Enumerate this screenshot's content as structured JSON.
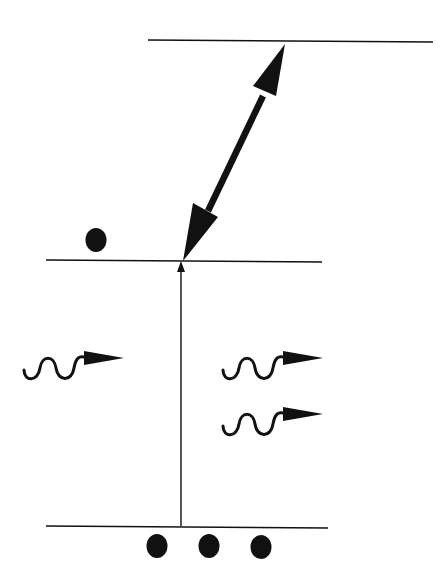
{
  "diagram": {
    "type": "energy-level-diagram",
    "colors": {
      "stroke": "#111111",
      "background": "#ffffff"
    },
    "levels": [
      {
        "id": "upper",
        "x1": 148,
        "x2": 433,
        "y": 41
      },
      {
        "id": "middle",
        "x1": 46,
        "x2": 322,
        "y": 261
      },
      {
        "id": "ground",
        "x1": 46,
        "x2": 328,
        "y": 527
      }
    ],
    "transitions": [
      {
        "id": "pump",
        "style": "thin-single-arrow",
        "from": "ground",
        "to": "middle"
      },
      {
        "id": "coupling",
        "style": "thick-double-arrow",
        "between": [
          "middle",
          "upper"
        ]
      }
    ],
    "photons": [
      {
        "id": "photon-left",
        "count": 1
      },
      {
        "id": "photon-right",
        "count": 2
      }
    ],
    "populations": [
      {
        "level": "middle",
        "dots": 1
      },
      {
        "level": "ground",
        "dots": 3
      }
    ]
  }
}
